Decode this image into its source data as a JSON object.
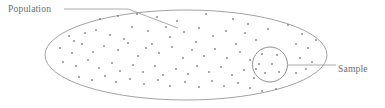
{
  "figure": {
    "background_color": "#ffffff",
    "stroke_color": "#8a8a8a",
    "text_color": "#6d6d6d",
    "dot_color": "#7a7a85",
    "width": 385,
    "height": 108
  },
  "labels": {
    "population": "Population",
    "sample": "Sample"
  },
  "chart_data": {
    "type": "scatter",
    "xlabel": "",
    "ylabel": "",
    "xlim": [
      0,
      385
    ],
    "ylim": [
      0,
      108
    ],
    "grid": false,
    "legend": "none",
    "annotations": [
      {
        "text": "Population",
        "x": 8,
        "y": 12,
        "leader_path": "M 64 9 L 128 9 L 178 28"
      },
      {
        "text": "Sample",
        "x": 338,
        "y": 72,
        "leader_path": "M 288 65 L 336 65"
      }
    ],
    "shapes": [
      {
        "name": "population-ellipse",
        "type": "ellipse",
        "cx": 186,
        "cy": 55,
        "rx": 141,
        "ry": 45
      },
      {
        "name": "sample-circle",
        "type": "circle",
        "cx": 270,
        "cy": 64.5,
        "r": 17.5
      }
    ],
    "series": [
      {
        "name": "population-points",
        "marker": "square-dot",
        "marker_size": 1.6,
        "count": 88,
        "points": [
          [
            100,
            19
          ],
          [
            118,
            16
          ],
          [
            137,
            14
          ],
          [
            157,
            17
          ],
          [
            177,
            21
          ],
          [
            206,
            14
          ],
          [
            233,
            19
          ],
          [
            248,
            24
          ],
          [
            268,
            29
          ],
          [
            288,
            25
          ],
          [
            302,
            34
          ],
          [
            69,
            36
          ],
          [
            74,
            41
          ],
          [
            85,
            33
          ],
          [
            96,
            30
          ],
          [
            110,
            35
          ],
          [
            124,
            39
          ],
          [
            132,
            27
          ],
          [
            148,
            31
          ],
          [
            152,
            44
          ],
          [
            166,
            27
          ],
          [
            170,
            37
          ],
          [
            184,
            32
          ],
          [
            196,
            42
          ],
          [
            199,
            28
          ],
          [
            213,
            36
          ],
          [
            226,
            31
          ],
          [
            236,
            44
          ],
          [
            245,
            33
          ],
          [
            256,
            40
          ],
          [
            296,
            44
          ],
          [
            308,
            48
          ],
          [
            316,
            40
          ],
          [
            60,
            48
          ],
          [
            72,
            53
          ],
          [
            82,
            44
          ],
          [
            93,
            52
          ],
          [
            104,
            46
          ],
          [
            118,
            50
          ],
          [
            128,
            43
          ],
          [
            138,
            56
          ],
          [
            146,
            48
          ],
          [
            159,
            53
          ],
          [
            172,
            47
          ],
          [
            183,
            58
          ],
          [
            192,
            50
          ],
          [
            204,
            56
          ],
          [
            215,
            49
          ],
          [
            227,
            58
          ],
          [
            240,
            52
          ],
          [
            250,
            60
          ],
          [
            300,
            58
          ],
          [
            312,
            62
          ],
          [
            63,
            62
          ],
          [
            76,
            66
          ],
          [
            88,
            60
          ],
          [
            99,
            68
          ],
          [
            112,
            63
          ],
          [
            120,
            71
          ],
          [
            133,
            65
          ],
          [
            143,
            72
          ],
          [
            155,
            66
          ],
          [
            163,
            75
          ],
          [
            176,
            69
          ],
          [
            188,
            74
          ],
          [
            197,
            66
          ],
          [
            209,
            72
          ],
          [
            221,
            67
          ],
          [
            232,
            75
          ],
          [
            244,
            70
          ],
          [
            254,
            78
          ],
          [
            296,
            73
          ],
          [
            306,
            69
          ],
          [
            79,
            77
          ],
          [
            92,
            80
          ],
          [
            105,
            76
          ],
          [
            116,
            82
          ],
          [
            130,
            79
          ],
          [
            144,
            84
          ],
          [
            158,
            80
          ],
          [
            170,
            86
          ],
          [
            185,
            82
          ],
          [
            199,
            87
          ],
          [
            212,
            81
          ],
          [
            224,
            86
          ],
          [
            238,
            83
          ],
          [
            250,
            88
          ],
          [
            262,
            91
          ],
          [
            276,
            89
          ]
        ]
      },
      {
        "name": "sample-points",
        "marker": "square-dot",
        "marker_size": 1.6,
        "count": 7,
        "points": [
          [
            262,
            54
          ],
          [
            277,
            55
          ],
          [
            259,
            64
          ],
          [
            272,
            64
          ],
          [
            265,
            73
          ],
          [
            279,
            72
          ],
          [
            256,
            69
          ]
        ]
      }
    ]
  }
}
